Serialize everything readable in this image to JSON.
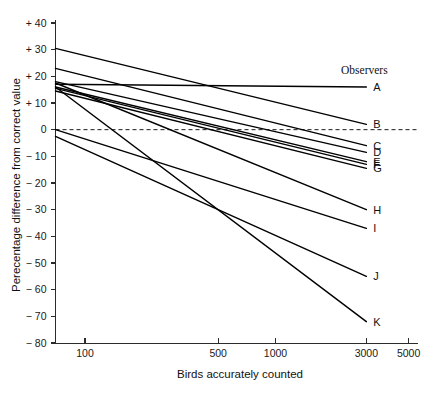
{
  "chart_data": {
    "type": "line",
    "title": "",
    "xlabel": "Birds accurately counted",
    "ylabel": "Perecentage difference from correct value",
    "legend_title": "Observers",
    "legend_position": "right-inline-end-of-line",
    "grid": false,
    "xscale": "log",
    "yscale": "linear",
    "xlim": [
      70,
      5600
    ],
    "ylim": [
      -80,
      40
    ],
    "xticks": [
      100,
      500,
      1000,
      3000,
      5000
    ],
    "xtick_labels": [
      "100",
      "500",
      "1000",
      "3000",
      "5000"
    ],
    "yticks": [
      40,
      30,
      20,
      10,
      0,
      -10,
      -20,
      -30,
      -40,
      -50,
      -60,
      -70,
      -80
    ],
    "ytick_labels": [
      "+ 40",
      "+ 30",
      "+ 20",
      "+ 10",
      "0",
      "− 10",
      "− 20",
      "− 30",
      "− 40",
      "− 50",
      "− 60",
      "− 70",
      "− 80"
    ],
    "reference_line": {
      "y": 0,
      "style": "dashed"
    },
    "x": [
      70,
      3000
    ],
    "series": [
      {
        "name": "A",
        "label": "A",
        "values": [
          17.0,
          16.0
        ]
      },
      {
        "name": "B",
        "label": "B",
        "values": [
          30.5,
          2.0
        ]
      },
      {
        "name": "C",
        "label": "C",
        "values": [
          23.0,
          -6.0
        ]
      },
      {
        "name": "D",
        "label": "D",
        "values": [
          18.0,
          -8.5
        ]
      },
      {
        "name": "E",
        "label": "E",
        "values": [
          16.0,
          -12.0
        ]
      },
      {
        "name": "F",
        "label": "F",
        "values": [
          15.5,
          -13.0
        ]
      },
      {
        "name": "G",
        "label": "G",
        "values": [
          14.5,
          -14.5
        ]
      },
      {
        "name": "H",
        "label": "H",
        "values": [
          17.5,
          -30.0
        ]
      },
      {
        "name": "I",
        "label": "I",
        "values": [
          0.0,
          -37.0
        ]
      },
      {
        "name": "J",
        "label": "J",
        "values": [
          -2.5,
          -55.0
        ]
      },
      {
        "name": "K",
        "label": "K",
        "values": [
          16.0,
          -72.0
        ]
      }
    ]
  }
}
